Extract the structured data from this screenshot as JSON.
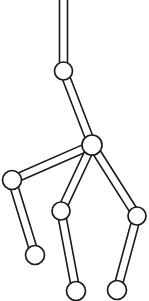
{
  "figure": {
    "type": "kinematic-skeleton-diagram",
    "canvas": {
      "width": 149,
      "height": 301,
      "background": "#ffffff"
    },
    "style": {
      "stroke_color": "#1a1a1a",
      "fill_color": "#ffffff",
      "bone_stroke_width": 1.6,
      "joint_stroke_width": 1.7,
      "bone_half_width": 4,
      "joint_radius": 9
    },
    "joints": [
      {
        "id": "root-top",
        "name": "root-top-offscreen",
        "label": "Root (off-canvas)",
        "x": 63.5,
        "y": -20,
        "radius": 0,
        "visible": false
      },
      {
        "id": "upper-joint",
        "name": "upper-joint",
        "label": "Upper Joint",
        "x": 63.5,
        "y": 71,
        "radius": 9,
        "visible": true
      },
      {
        "id": "hub",
        "name": "hub-joint",
        "label": "Central Hub",
        "x": 92,
        "y": 145,
        "radius": 10,
        "visible": true
      },
      {
        "id": "left-joint",
        "name": "left-limb-joint",
        "label": "Left Limb Joint",
        "x": 12,
        "y": 180,
        "radius": 9.5,
        "visible": true
      },
      {
        "id": "left-end",
        "name": "left-limb-end",
        "label": "Left Limb End",
        "x": 35,
        "y": 255,
        "radius": 9.5,
        "visible": true
      },
      {
        "id": "middle-joint",
        "name": "middle-limb-joint",
        "label": "Middle Limb Joint",
        "x": 61,
        "y": 211,
        "radius": 9,
        "visible": true
      },
      {
        "id": "middle-end",
        "name": "middle-limb-end",
        "label": "Middle Limb End",
        "x": 76,
        "y": 291,
        "radius": 9.5,
        "visible": true
      },
      {
        "id": "right-joint",
        "name": "right-limb-joint",
        "label": "Right Limb Joint",
        "x": 137,
        "y": 216,
        "radius": 9,
        "visible": true
      },
      {
        "id": "right-end",
        "name": "right-limb-end",
        "label": "Right Limb End",
        "x": 117,
        "y": 290,
        "radius": 9.5,
        "visible": true
      }
    ],
    "bones": [
      {
        "id": "bone-root",
        "name": "bone-root-to-upper",
        "label": "Root Segment",
        "from": "root-top",
        "to": "upper-joint",
        "half_width": 4
      },
      {
        "id": "bone-upper-hub",
        "name": "bone-upper-to-hub",
        "label": "Upper Segment",
        "from": "upper-joint",
        "to": "hub",
        "half_width": 4
      },
      {
        "id": "bone-hub-left",
        "name": "bone-hub-to-left-joint",
        "label": "Left Upper Limb",
        "from": "hub",
        "to": "left-joint",
        "half_width": 4
      },
      {
        "id": "bone-left-lower",
        "name": "bone-left-joint-to-end",
        "label": "Left Lower Limb",
        "from": "left-joint",
        "to": "left-end",
        "half_width": 4
      },
      {
        "id": "bone-hub-middle",
        "name": "bone-hub-to-middle-joint",
        "label": "Middle Upper Limb",
        "from": "hub",
        "to": "middle-joint",
        "half_width": 4
      },
      {
        "id": "bone-middle-lower",
        "name": "bone-middle-joint-to-end",
        "label": "Middle Lower Limb",
        "from": "middle-joint",
        "to": "middle-end",
        "half_width": 4
      },
      {
        "id": "bone-hub-right",
        "name": "bone-hub-to-right-joint",
        "label": "Right Upper Limb",
        "from": "hub",
        "to": "right-joint",
        "half_width": 4
      },
      {
        "id": "bone-right-lower",
        "name": "bone-right-joint-to-end",
        "label": "Right Lower Limb",
        "from": "right-joint",
        "to": "right-end",
        "half_width": 4
      }
    ]
  }
}
